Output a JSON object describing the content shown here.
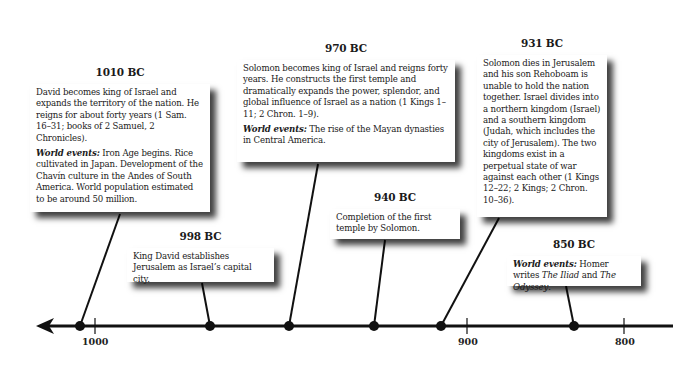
{
  "timeline": {
    "axis": {
      "ticks": [
        {
          "label": "1000",
          "x": 95
        },
        {
          "label": "900",
          "x": 467
        },
        {
          "label": "800",
          "x": 624
        }
      ],
      "direction": "left-arrow"
    },
    "events": [
      {
        "date": "1010 BC",
        "text": "David becomes king of Israel and expands the territory of the nation. He reigns for about forty years (1 Sam. 16–31; books of 2 Samuel, 2 Chronicles).",
        "world_label": "World events:",
        "world_text": " Iron Age begins. Rice cultivated in Japan. Development of the Chavín culture in the Andes of South America. World population estimated to be around 50 million."
      },
      {
        "date": "998 BC",
        "text": "King David establishes Jerusalem as Israel’s capital city."
      },
      {
        "date": "970 BC",
        "text": "Solomon becomes king of Israel and reigns forty years. He constructs the first temple and dramatically expands the power, splendor, and global influence of Israel as a nation (1 Kings 1–11; 2 Chron. 1–9).",
        "world_label": "World events:",
        "world_text": " The rise of the Mayan dynasties in Central America."
      },
      {
        "date": "940 BC",
        "text": "Completion of the first temple by Solomon."
      },
      {
        "date": "931 BC",
        "text": "Solomon dies in Jerusalem and his son Rehoboam is unable to hold the nation together. Israel divides into a northern kingdom (Israel) and a southern kingdom (Judah, which includes the city of Jerusalem). The two kingdoms exist in a perpetual state of war against each other (1 Kings 12–22; 2 Kings; 2 Chron. 10–36)."
      },
      {
        "date": "850 BC",
        "world_label": "World events:",
        "world_text_1": " Homer writes ",
        "title_1": "The Iliad",
        "and": " and ",
        "title_2": "The Odyssey",
        "end": "."
      }
    ]
  },
  "colors": {
    "line": "#111111",
    "card_bg": "#ffffff",
    "text": "#1a1a1a"
  }
}
